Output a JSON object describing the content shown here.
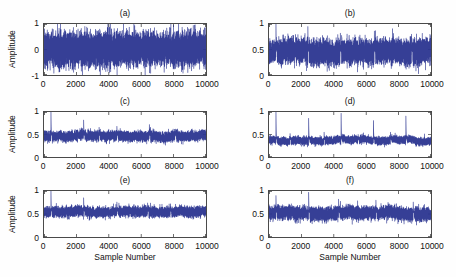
{
  "figure": {
    "background": "#fefefe"
  },
  "chart_data": {
    "type": "line",
    "layout": "3 rows x 2 columns of subplots",
    "xlabel": "Sample Number",
    "ylabel": "Amplitude",
    "x_range": [
      0,
      10000
    ],
    "n_samples": 10000,
    "xtick_labels": [
      "0",
      "2000",
      "4000",
      "6000",
      "8000",
      "10000"
    ],
    "line_color": "#2b3590",
    "axis_color": "#4a4a4a",
    "grid": false,
    "legend": "none",
    "subplots": [
      {
        "id": "a",
        "title": "(a)",
        "ylim": [
          -1,
          1
        ],
        "ytick_labels": [
          "1",
          "0",
          "-1"
        ],
        "baseline": 0,
        "noise_sigma": 0.3,
        "clip": [
          -1,
          1
        ],
        "spikes": []
      },
      {
        "id": "b",
        "title": "(b)",
        "ylim": [
          0,
          1
        ],
        "ytick_labels": [
          "1",
          "0.5",
          "0"
        ],
        "baseline": 0.45,
        "noise_sigma": 0.11,
        "clip": [
          0,
          1
        ],
        "spikes": [
          {
            "x": 430,
            "peak": 1.0
          },
          {
            "x": 2400,
            "peak": 0.95
          },
          {
            "x": 4400,
            "peak": 0.82
          },
          {
            "x": 6500,
            "peak": 0.86
          },
          {
            "x": 8800,
            "peak": 0.8
          }
        ]
      },
      {
        "id": "c",
        "title": "(c)",
        "ylim": [
          0,
          1
        ],
        "ytick_labels": [
          "1",
          "0.5",
          "0"
        ],
        "baseline": 0.47,
        "noise_sigma": 0.05,
        "clip": [
          0,
          1
        ],
        "spikes": [
          {
            "x": 430,
            "peak": 1.0
          },
          {
            "x": 2450,
            "peak": 0.82
          },
          {
            "x": 3400,
            "peak": 0.66
          },
          {
            "x": 4500,
            "peak": 0.68
          },
          {
            "x": 6500,
            "peak": 0.72
          },
          {
            "x": 8100,
            "peak": 0.62
          }
        ]
      },
      {
        "id": "d",
        "title": "(d)",
        "ylim": [
          0,
          1
        ],
        "ytick_labels": [
          "1",
          "0.5",
          "0"
        ],
        "baseline": 0.38,
        "noise_sigma": 0.038,
        "clip": [
          0,
          1
        ],
        "spikes": [
          {
            "x": 430,
            "peak": 1.0
          },
          {
            "x": 2450,
            "peak": 0.86
          },
          {
            "x": 4450,
            "peak": 0.97
          },
          {
            "x": 6450,
            "peak": 0.81
          },
          {
            "x": 8450,
            "peak": 0.91
          },
          {
            "x": 1300,
            "peak": 0.52
          },
          {
            "x": 3400,
            "peak": 0.55
          },
          {
            "x": 5500,
            "peak": 0.5
          },
          {
            "x": 7500,
            "peak": 0.55
          }
        ]
      },
      {
        "id": "e",
        "title": "(e)",
        "ylim": [
          0,
          1
        ],
        "ytick_labels": [
          "1",
          "0.5",
          "0"
        ],
        "baseline": 0.55,
        "noise_sigma": 0.05,
        "clip": [
          0,
          1
        ],
        "spikes": [
          {
            "x": 430,
            "peak": 1.0
          },
          {
            "x": 2450,
            "peak": 0.85
          },
          {
            "x": 4500,
            "peak": 0.76
          },
          {
            "x": 6400,
            "peak": 0.74
          },
          {
            "x": 7800,
            "peak": 0.72
          }
        ]
      },
      {
        "id": "f",
        "title": "(f)",
        "ylim": [
          0,
          1
        ],
        "ytick_labels": [
          "1",
          "0.5",
          "0"
        ],
        "baseline": 0.52,
        "noise_sigma": 0.065,
        "clip": [
          0,
          1
        ],
        "spikes": [
          {
            "x": 430,
            "peak": 0.9
          },
          {
            "x": 2450,
            "peak": 0.97
          },
          {
            "x": 4300,
            "peak": 0.82
          },
          {
            "x": 6600,
            "peak": 0.8
          },
          {
            "x": 8900,
            "peak": 0.76
          }
        ]
      }
    ]
  }
}
